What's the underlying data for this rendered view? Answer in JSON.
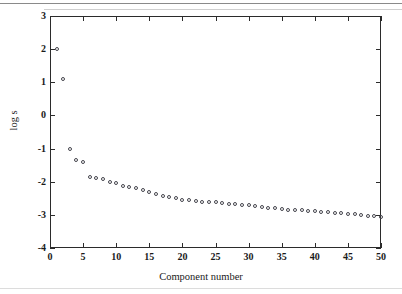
{
  "figure": {
    "background_color": "#ffffff",
    "axis_color": "#2b2b2b",
    "marker_color": "#45454d"
  },
  "chart_data": {
    "type": "scatter",
    "title": "",
    "xlabel": "Component number",
    "ylabel": "log s",
    "xlim": [
      0,
      50
    ],
    "ylim": [
      -4,
      3
    ],
    "xticks": [
      0,
      5,
      10,
      15,
      20,
      25,
      30,
      35,
      40,
      45,
      50
    ],
    "xtick_labels": [
      "0",
      "5",
      "10",
      "15",
      "20",
      "25",
      "30",
      "35",
      "40",
      "45",
      "50"
    ],
    "yticks": [
      -4,
      -3,
      -2,
      -1,
      0,
      1,
      2,
      3
    ],
    "ytick_labels": [
      "-4",
      "-3",
      "-2",
      "-1",
      "0",
      "1",
      "2",
      "3"
    ],
    "grid": false,
    "legend": null,
    "marker_style": "open-circle",
    "series": [
      {
        "name": "log s",
        "x": [
          1,
          2,
          3,
          4,
          5,
          6,
          7,
          8,
          9,
          10,
          11,
          12,
          13,
          14,
          15,
          16,
          17,
          18,
          19,
          20,
          21,
          22,
          23,
          24,
          25,
          26,
          27,
          28,
          29,
          30,
          31,
          32,
          33,
          34,
          35,
          36,
          37,
          38,
          39,
          40,
          41,
          42,
          43,
          44,
          45,
          46,
          47,
          48,
          49,
          50
        ],
        "values": [
          2.0,
          1.1,
          -1.0,
          -1.34,
          -1.42,
          -1.85,
          -1.9,
          -1.92,
          -2.0,
          -2.04,
          -2.12,
          -2.16,
          -2.2,
          -2.24,
          -2.32,
          -2.36,
          -2.44,
          -2.47,
          -2.5,
          -2.54,
          -2.55,
          -2.58,
          -2.6,
          -2.61,
          -2.62,
          -2.64,
          -2.66,
          -2.68,
          -2.7,
          -2.71,
          -2.73,
          -2.76,
          -2.78,
          -2.8,
          -2.82,
          -2.84,
          -2.85,
          -2.86,
          -2.88,
          -2.89,
          -2.9,
          -2.91,
          -2.93,
          -2.95,
          -2.96,
          -2.98,
          -3.0,
          -3.02,
          -3.04,
          -3.05
        ]
      }
    ]
  }
}
